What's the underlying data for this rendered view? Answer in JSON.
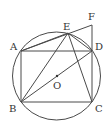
{
  "diagram": {
    "type": "geometry",
    "colors": {
      "stroke": "#4a4a4a",
      "text": "#333333",
      "background": "#ffffff"
    },
    "circle": {
      "center": "O",
      "cx": 56.5,
      "cy": 76,
      "r": 44
    },
    "points": {
      "A": {
        "label": "A",
        "x": 21,
        "y": 51,
        "lx": 10,
        "ly": 50
      },
      "B": {
        "label": "B",
        "x": 21,
        "y": 102,
        "lx": 9,
        "ly": 112
      },
      "C": {
        "label": "C",
        "x": 92,
        "y": 102,
        "lx": 95,
        "ly": 112
      },
      "D": {
        "label": "D",
        "x": 92,
        "y": 51,
        "lx": 95,
        "ly": 50
      },
      "E": {
        "label": "E",
        "x": 68,
        "y": 33,
        "lx": 63,
        "ly": 30
      },
      "F": {
        "label": "F",
        "x": 92,
        "y": 25,
        "lx": 88,
        "ly": 20
      },
      "O": {
        "label": "O",
        "x": 57,
        "y": 76,
        "lx": 53,
        "ly": 89
      }
    },
    "segments": [
      [
        "A",
        "D"
      ],
      [
        "D",
        "C"
      ],
      [
        "C",
        "B"
      ],
      [
        "B",
        "A"
      ],
      [
        "A",
        "F"
      ],
      [
        "F",
        "D"
      ],
      [
        "E",
        "B"
      ],
      [
        "E",
        "C"
      ],
      [
        "E",
        "D"
      ],
      [
        "B",
        "D"
      ],
      [
        "A",
        "E"
      ]
    ]
  }
}
